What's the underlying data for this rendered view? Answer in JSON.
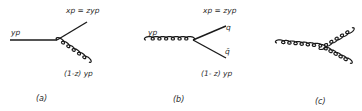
{
  "figure": {
    "panels": [
      {
        "id": "a",
        "caption": "(a)",
        "incoming": {
          "type": "quark",
          "label": "yp"
        },
        "outgoing": [
          {
            "type": "quark",
            "label": "xp = zyp"
          },
          {
            "type": "gluon",
            "label": "(1-z) yp"
          }
        ]
      },
      {
        "id": "b",
        "caption": "(b)",
        "incoming": {
          "type": "gluon",
          "label": "yp"
        },
        "outgoing": [
          {
            "type": "quark",
            "label": "xp = zyp",
            "particle": "q"
          },
          {
            "type": "antiquark",
            "label": "(1- z) yp",
            "particle": "q̄"
          }
        ]
      },
      {
        "id": "c",
        "caption": "(c)",
        "incoming": {
          "type": "gluon",
          "label": ""
        },
        "outgoing": [
          {
            "type": "gluon",
            "label": ""
          },
          {
            "type": "gluon",
            "label": ""
          }
        ]
      }
    ]
  },
  "colors": {
    "line": "#1a1a1a",
    "text": "#2a2a2a",
    "background": "#ffffff"
  }
}
